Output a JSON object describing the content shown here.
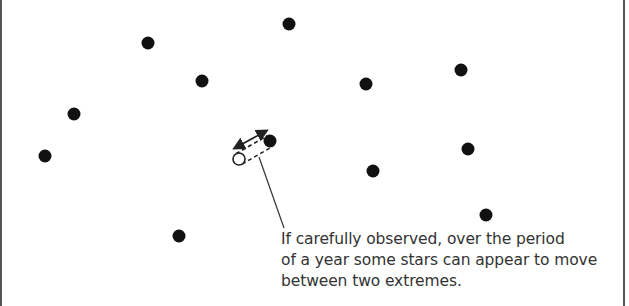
{
  "diagram": {
    "colors": {
      "star": "#111111",
      "line": "#333333",
      "text": "#333333",
      "border": "#555555",
      "background": "#ffffff"
    },
    "stars": [
      {
        "x": 148,
        "y": 43
      },
      {
        "x": 289,
        "y": 24
      },
      {
        "x": 202,
        "y": 81
      },
      {
        "x": 366,
        "y": 84
      },
      {
        "x": 461,
        "y": 70
      },
      {
        "x": 74,
        "y": 114
      },
      {
        "x": 45,
        "y": 156
      },
      {
        "x": 468,
        "y": 149
      },
      {
        "x": 373,
        "y": 171
      },
      {
        "x": 486,
        "y": 215
      },
      {
        "x": 179,
        "y": 236
      }
    ],
    "parallax_star": {
      "position_a": {
        "x": 270,
        "y": 141,
        "style": "filled"
      },
      "position_b": {
        "x": 239,
        "y": 159,
        "style": "open"
      },
      "double_arrow": {
        "from": {
          "x": 235,
          "y": 148
        },
        "to": {
          "x": 266,
          "y": 131
        }
      }
    },
    "leader_line": {
      "from": {
        "x": 259,
        "y": 157
      },
      "to": {
        "x": 284,
        "y": 228
      }
    },
    "caption_lines": [
      "If carefully observed, over the period",
      "of a year some stars can appear to move",
      "between two extremes."
    ]
  }
}
